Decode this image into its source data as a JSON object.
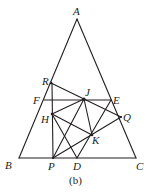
{
  "diagram": {
    "caption": "(b)",
    "points": {
      "A": {
        "label": "A",
        "x": 77,
        "y": 19
      },
      "B": {
        "label": "B",
        "x": 19,
        "y": 158
      },
      "C": {
        "label": "C",
        "x": 136,
        "y": 158
      },
      "R": {
        "label": "R",
        "x": 51,
        "y": 83
      },
      "F": {
        "label": "F",
        "x": 44,
        "y": 100
      },
      "H": {
        "label": "H",
        "x": 52,
        "y": 114
      },
      "J": {
        "label": "J",
        "x": 84,
        "y": 99
      },
      "E": {
        "label": "E",
        "x": 111,
        "y": 100
      },
      "Q": {
        "label": "Q",
        "x": 121,
        "y": 117
      },
      "K": {
        "label": "K",
        "x": 92,
        "y": 135
      },
      "P": {
        "label": "P",
        "x": 53,
        "y": 158
      },
      "D": {
        "label": "D",
        "x": 77,
        "y": 158
      }
    },
    "segments": [
      [
        "A",
        "B"
      ],
      [
        "A",
        "C"
      ],
      [
        "B",
        "C"
      ],
      [
        "R",
        "P"
      ],
      [
        "F",
        "E"
      ],
      [
        "R",
        "Q"
      ],
      [
        "H",
        "J"
      ],
      [
        "H",
        "K"
      ],
      [
        "H",
        "D"
      ],
      [
        "J",
        "P"
      ],
      [
        "J",
        "K"
      ],
      [
        "P",
        "Q"
      ],
      [
        "D",
        "E"
      ]
    ]
  }
}
